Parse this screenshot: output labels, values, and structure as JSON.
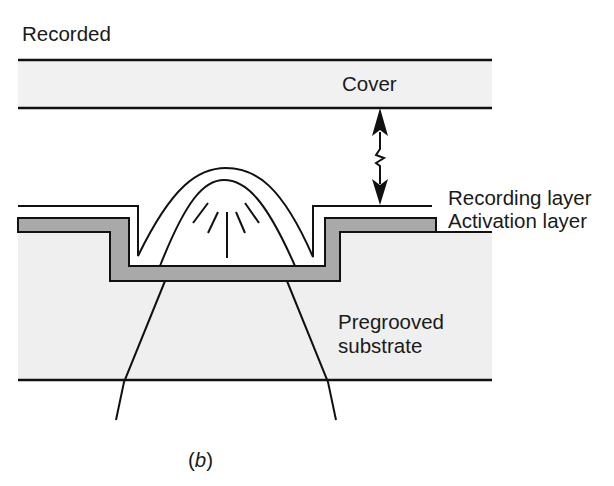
{
  "figure": {
    "title": "Recorded",
    "caption": {
      "prefix": "(",
      "letter": "b",
      "suffix": ")"
    }
  },
  "layers": {
    "cover": {
      "label": "Cover",
      "fill": "#f1f1f1"
    },
    "recording": {
      "label": "Recording layer"
    },
    "activation": {
      "label": "Activation layer",
      "fill": "#a9a9a9"
    },
    "substrate": {
      "label_line1": "Pregrooved",
      "label_line2": "substrate",
      "fill": "#efefef"
    }
  },
  "annotations": {
    "gap_arrow": "double-headed-arrow-with-break-icon",
    "bubble": "recorded-bubble-dome",
    "light_beam": "focused-laser-beam"
  },
  "colors": {
    "line": "#111111",
    "background": "#ffffff"
  }
}
